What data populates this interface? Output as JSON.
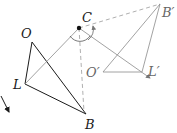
{
  "diagram": {
    "type": "geometry-rotation",
    "colors": {
      "solid": "#1a1a1a",
      "gray": "#8a8a8a",
      "dashed": "#9a9a9a"
    },
    "labels": {
      "O": "O",
      "L": "L",
      "B": "B",
      "C": "C",
      "B_prime": "B′",
      "O_prime": "O′",
      "L_prime": "L′"
    },
    "points": {
      "O": [
        32,
        42
      ],
      "L": [
        25,
        84
      ],
      "B": [
        86,
        114
      ],
      "C": [
        79,
        28
      ],
      "B_prime": [
        160,
        4
      ],
      "O_prime": [
        103,
        72
      ],
      "L_prime": [
        142,
        72
      ]
    }
  }
}
